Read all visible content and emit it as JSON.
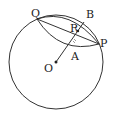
{
  "diagram": {
    "type": "geometry",
    "labels": {
      "Q": "Q",
      "B": "B",
      "R": "R",
      "P": "P",
      "A": "A",
      "O": "O"
    },
    "colors": {
      "line": "#333333",
      "background": "#ffffff"
    }
  }
}
